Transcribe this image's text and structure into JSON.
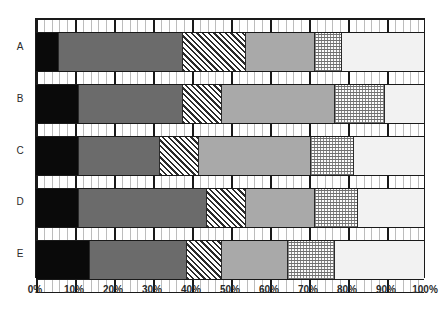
{
  "chart_data": {
    "type": "bar",
    "orientation": "horizontal",
    "stacked": true,
    "normalized": true,
    "title": "",
    "subtitle": "",
    "xlabel": "",
    "ylabel": "",
    "xlim": [
      0,
      100
    ],
    "grid": false,
    "legend": "none",
    "x_tick_labels": [
      "0%",
      "10%",
      "20%",
      "30%",
      "40%",
      "50%",
      "60%",
      "70%",
      "80%",
      "90%",
      "100%"
    ],
    "x_tick_values": [
      0,
      10,
      20,
      30,
      40,
      50,
      60,
      70,
      80,
      90,
      100
    ],
    "x_minor_tick_step": 2,
    "categories": [
      "A",
      "B",
      "C",
      "D",
      "E"
    ],
    "series": [
      {
        "name": "Segment 1",
        "style": "solid-black",
        "color": "#0a0a0a",
        "values": [
          6,
          11,
          11,
          11,
          14
        ]
      },
      {
        "name": "Segment 2",
        "style": "solid-dark-gray",
        "color": "#6b6b6b",
        "values": [
          32,
          27,
          21,
          33,
          25
        ]
      },
      {
        "name": "Segment 3",
        "style": "diagonal-hatch",
        "color": "#2b2b2b",
        "values": [
          16,
          10,
          10,
          10,
          9
        ]
      },
      {
        "name": "Segment 4",
        "style": "solid-mid-gray",
        "color": "#a9a9a9",
        "values": [
          18,
          29,
          29,
          18,
          17
        ]
      },
      {
        "name": "Segment 5",
        "style": "dotted-grid",
        "color": "#8a8a8a",
        "values": [
          7,
          13,
          11,
          11,
          12
        ]
      },
      {
        "name": "Segment 6",
        "style": "solid-light-gray",
        "color": "#f2f2f2",
        "values": [
          21,
          10,
          18,
          17,
          23
        ]
      }
    ],
    "stack_boundaries": {
      "A": [
        0,
        6,
        38,
        54,
        72,
        79,
        100
      ],
      "B": [
        0,
        11,
        38,
        48,
        77,
        90,
        100
      ],
      "C": [
        0,
        11,
        32,
        42,
        71,
        82,
        100
      ],
      "D": [
        0,
        11,
        44,
        54,
        72,
        83,
        100
      ],
      "E": [
        0,
        14,
        39,
        48,
        65,
        77,
        100
      ]
    }
  },
  "axis": {
    "y_categories": [
      "A",
      "B",
      "C",
      "D",
      "E"
    ],
    "x_labels": [
      "0%",
      "10%",
      "20%",
      "30%",
      "40%",
      "50%",
      "60%",
      "70%",
      "80%",
      "90%",
      "100%"
    ]
  },
  "colors": {
    "frame": "#1a1a1a",
    "background": "#ffffff",
    "segment_black": "#0a0a0a",
    "segment_dark_gray": "#6b6b6b",
    "segment_mid_gray": "#a9a9a9",
    "segment_light_gray": "#f2f2f2",
    "hatch_stroke": "#2b2b2b",
    "dot_stroke": "#8a8a8a",
    "tick_major": "#1a1a1a",
    "tick_minor": "#bcbcbc",
    "text": "#2a2a2a"
  }
}
